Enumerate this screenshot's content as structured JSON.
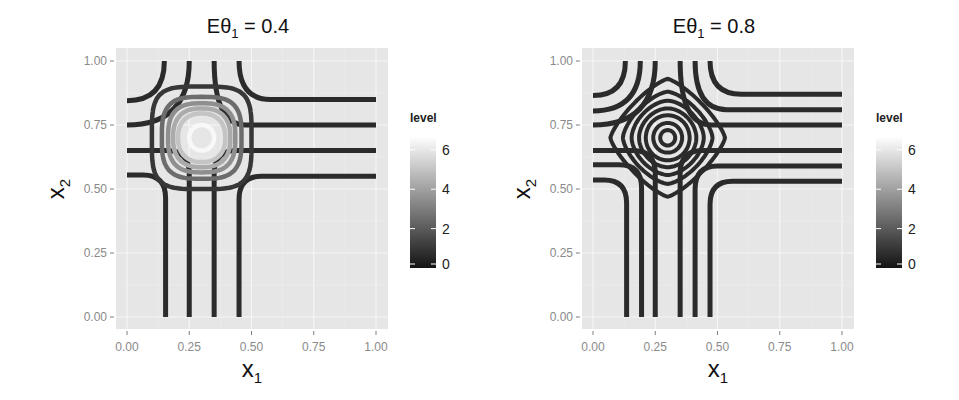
{
  "chart_data": [
    {
      "type": "contour",
      "title": "Eθ1 = 0.4",
      "title_parts": {
        "base": "Eθ",
        "sub": "1",
        "eq": " = 0.4"
      },
      "xlabel": "x1",
      "ylabel": "x2",
      "xlim": [
        0,
        1
      ],
      "ylim": [
        0,
        1
      ],
      "xticks": [
        "0.00",
        "0.25",
        "0.50",
        "0.75",
        "1.00"
      ],
      "yticks": [
        "0.00",
        "0.25",
        "0.50",
        "0.75",
        "1.00"
      ],
      "grid": true,
      "legend": {
        "title": "level",
        "position": "right",
        "ticks": [
          "0",
          "2",
          "4",
          "6"
        ],
        "range": [
          0,
          6.6
        ]
      },
      "center": [
        0.3,
        0.7
      ],
      "vertical_lines_x1": [
        0.155,
        0.25,
        0.35,
        0.45
      ],
      "horizontal_lines_x2": [
        0.85,
        0.75,
        0.65,
        0.55
      ],
      "rings": [
        {
          "level": 1.0,
          "radius": 0.2,
          "shape": 4.0
        },
        {
          "level": 2.5,
          "radius": 0.16,
          "shape": 3.2
        },
        {
          "level": 3.5,
          "radius": 0.135,
          "shape": 2.8
        },
        {
          "level": 4.3,
          "radius": 0.115,
          "shape": 2.5
        },
        {
          "level": 5.0,
          "radius": 0.095,
          "shape": 2.3
        },
        {
          "level": 6.5,
          "radius": 0.05,
          "shape": 2.0
        }
      ]
    },
    {
      "type": "contour",
      "title": "Eθ1 = 0.8",
      "title_parts": {
        "base": "Eθ",
        "sub": "1",
        "eq": " = 0.8"
      },
      "xlabel": "x1",
      "ylabel": "x2",
      "xlim": [
        0,
        1
      ],
      "ylim": [
        0,
        1
      ],
      "xticks": [
        "0.00",
        "0.25",
        "0.50",
        "0.75",
        "1.00"
      ],
      "yticks": [
        "0.00",
        "0.25",
        "0.50",
        "0.75",
        "1.00"
      ],
      "grid": true,
      "legend": {
        "title": "level",
        "position": "right",
        "ticks": [
          "0",
          "2",
          "4",
          "6"
        ],
        "range": [
          0,
          6.6
        ]
      },
      "center": [
        0.3,
        0.7
      ],
      "vertical_lines_x1": [
        0.135,
        0.195,
        0.25,
        0.35,
        0.41,
        0.47
      ],
      "horizontal_lines_x2": [
        0.87,
        0.81,
        0.75,
        0.65,
        0.59,
        0.53
      ],
      "rings": [
        {
          "level": 0.5,
          "radius": 0.23,
          "shape": 1.3
        },
        {
          "level": 0.6,
          "radius": 0.18,
          "shape": 1.5
        },
        {
          "level": 0.7,
          "radius": 0.145,
          "shape": 1.7
        },
        {
          "level": 0.8,
          "radius": 0.115,
          "shape": 1.85
        },
        {
          "level": 0.9,
          "radius": 0.088,
          "shape": 2.0
        },
        {
          "level": 1.0,
          "radius": 0.058,
          "shape": 2.0
        },
        {
          "level": 1.1,
          "radius": 0.03,
          "shape": 2.0
        }
      ]
    }
  ]
}
